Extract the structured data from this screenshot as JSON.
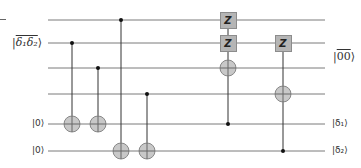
{
  "diagram": {
    "type": "quantum-circuit",
    "wire_color": "#7a7a7a",
    "gate_fill": "#b5b5b5",
    "target_fill": "#c8c8c8",
    "wires": [
      {
        "y": 20
      },
      {
        "y": 43
      },
      {
        "y": 68
      },
      {
        "y": 94
      },
      {
        "y": 124
      },
      {
        "y": 151
      }
    ],
    "wire_x_start": 48,
    "wire_x_end": 325,
    "left_labels": {
      "group": "|δ̄₁δ̄₂⟩",
      "group_text": "δ₁δ₂",
      "q5": "|0⟩",
      "q6": "|0⟩"
    },
    "right_labels": {
      "group": "|00⟩",
      "group_text": "00",
      "q5": "|δ₁⟩",
      "q6": "|δ₂⟩"
    },
    "gates": [
      {
        "type": "cnot",
        "x": 72,
        "control": 1,
        "target": 4
      },
      {
        "type": "cnot",
        "x": 98,
        "control": 2,
        "target": 4
      },
      {
        "type": "cnot",
        "x": 121,
        "control": 0,
        "target": 5
      },
      {
        "type": "cnot",
        "x": 147,
        "control": 3,
        "target": 5
      },
      {
        "type": "controlled",
        "x": 228,
        "control": 4,
        "z_on": [
          0,
          1
        ],
        "target": 2
      },
      {
        "type": "controlled",
        "x": 283,
        "control": 5,
        "z_on": [
          1
        ],
        "target": 3
      }
    ],
    "z_label": "Z"
  }
}
